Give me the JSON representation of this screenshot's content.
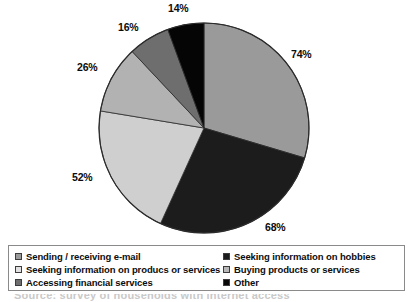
{
  "chart_data": {
    "type": "pie",
    "title": "",
    "subtitle": "",
    "xlabel": "",
    "ylabel": "",
    "legend_position": "bottom",
    "grid": false,
    "categories": [
      "Sending / receiving e-mail",
      "Seeking information on hobbies",
      "Seeking information on producs or services",
      "Buying products or services",
      "Accessing financial services",
      "Other"
    ],
    "values": [
      74,
      68,
      52,
      26,
      16,
      14
    ],
    "value_labels": [
      "74%",
      "68%",
      "52%",
      "26%",
      "16%",
      "14%"
    ],
    "colors": [
      "#9a9a9a",
      "#1c1c1c",
      "#cfcfcf",
      "#b2b2b2",
      "#6e6e6e",
      "#050505"
    ],
    "slice_order": [
      {
        "label": "74%",
        "value": 74,
        "color": "#9a9a9a",
        "start_deg": 0,
        "sweep_deg": 106.56
      },
      {
        "label": "68%",
        "value": 68,
        "color": "#1c1c1c",
        "start_deg": 106.56,
        "sweep_deg": 97.92
      },
      {
        "label": "52%",
        "value": 52,
        "color": "#cfcfcf",
        "start_deg": 204.48,
        "sweep_deg": 74.88
      },
      {
        "label": "26%",
        "value": 26,
        "color": "#b2b2b2",
        "start_deg": 279.36,
        "sweep_deg": 37.44
      },
      {
        "label": "16%",
        "value": 16,
        "color": "#6e6e6e",
        "start_deg": 316.8,
        "sweep_deg": 23.04
      },
      {
        "label": "14%",
        "value": 14,
        "color": "#050505",
        "start_deg": 339.84,
        "sweep_deg": 20.16
      }
    ],
    "total": 250
  },
  "labels": {
    "p74": "74%",
    "p68": "68%",
    "p52": "52%",
    "p26": "26%",
    "p16": "16%",
    "p14": "14%"
  },
  "legend": {
    "rows": [
      {
        "left": {
          "label": "Sending / receiving e-mail",
          "color": "#9a9a9a"
        },
        "right": {
          "label": "Seeking information on hobbies",
          "color": "#1c1c1c"
        }
      },
      {
        "left": {
          "label": "Seeking information on producs or services",
          "color": "#e2e2e2"
        },
        "right": {
          "label": "Buying products or services",
          "color": "#b8b8b8"
        }
      },
      {
        "left": {
          "label": "Accessing financial services",
          "color": "#6e6e6e"
        },
        "right": {
          "label": "Other",
          "color": "#080808"
        }
      }
    ]
  },
  "caption": {
    "text": "Source: survey of households with internet access"
  },
  "style": {
    "pie_center_x": 204,
    "pie_center_y": 128,
    "pie_radius": 105,
    "outline": "#2b2b2b"
  }
}
